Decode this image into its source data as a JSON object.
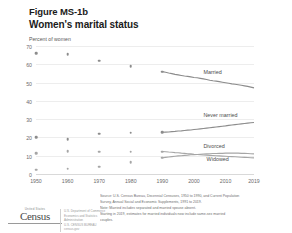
{
  "header": {
    "figure_label": "Figure MS-1b",
    "title": "Women's marital status",
    "axis_title": "Percent of women"
  },
  "footer": {
    "note_lines": [
      "Source: U.S. Census Bureau, Decennial Censuses, 1950 to 1990, and Current Population",
      "Survey, Annual Social and Economic Supplements, 1991 to 2019.",
      "Note: Married includes separated and married spouse absent.",
      "Starting in 2019,  estimates for married individuals now include same-sex married",
      "couples."
    ],
    "logo": {
      "eyebrow": "United States",
      "wordmark": "Census",
      "side_lines": [
        "U.S. Department of Commerce",
        "Economics and Statistics Administration",
        "U.S. CENSUS BUREAU",
        "census.gov"
      ]
    }
  },
  "chart_data": {
    "type": "line",
    "title": "Women's marital status",
    "subtitle": "Figure MS-1b",
    "xlabel": "",
    "ylabel": "Percent of women",
    "xlim": [
      1950,
      2019
    ],
    "ylim": [
      0,
      70
    ],
    "yticks": [
      0,
      10,
      20,
      30,
      40,
      50,
      60,
      70
    ],
    "xticks": [
      1950,
      1960,
      1970,
      1980,
      1990,
      2000,
      2010,
      2019
    ],
    "grid": true,
    "legend_position": "inline-right",
    "decennial_x": [
      1950,
      1960,
      1970,
      1980,
      1990
    ],
    "series": [
      {
        "name": "Married",
        "color": "#8c8c8c",
        "label_x": 2003,
        "label_y": 56,
        "decennial_values": [
          66.1,
          65.6,
          61.9,
          58.9,
          56.0
        ],
        "x": [
          1990,
          1991,
          1992,
          1993,
          1994,
          1995,
          1996,
          1997,
          1998,
          1999,
          2000,
          2001,
          2002,
          2003,
          2004,
          2005,
          2006,
          2007,
          2008,
          2009,
          2010,
          2011,
          2012,
          2013,
          2014,
          2015,
          2016,
          2017,
          2018,
          2019
        ],
        "values": [
          56.0,
          55.6,
          55.2,
          54.9,
          54.5,
          54.2,
          53.9,
          53.6,
          53.4,
          53.1,
          52.8,
          52.6,
          52.3,
          52.0,
          51.7,
          51.3,
          51.0,
          50.8,
          50.5,
          50.2,
          49.9,
          49.6,
          49.3,
          49.1,
          48.8,
          48.5,
          48.2,
          47.9,
          47.5,
          47.1
        ]
      },
      {
        "name": "Never married",
        "color": "#8c8c8c",
        "label_x": 2003,
        "label_y": 32,
        "decennial_values": [
          20.0,
          19.0,
          22.1,
          22.5,
          22.8
        ],
        "x": [
          1990,
          1991,
          1992,
          1993,
          1994,
          1995,
          1996,
          1997,
          1998,
          1999,
          2000,
          2001,
          2002,
          2003,
          2004,
          2005,
          2006,
          2007,
          2008,
          2009,
          2010,
          2011,
          2012,
          2013,
          2014,
          2015,
          2016,
          2017,
          2018,
          2019
        ],
        "values": [
          22.8,
          22.9,
          23.0,
          23.2,
          23.3,
          23.5,
          23.6,
          23.8,
          24.0,
          24.1,
          24.3,
          24.5,
          24.7,
          24.9,
          25.1,
          25.3,
          25.5,
          25.7,
          25.9,
          26.1,
          26.3,
          26.6,
          26.8,
          27.0,
          27.2,
          27.4,
          27.6,
          27.8,
          28.0,
          28.2
        ]
      },
      {
        "name": "Divorced",
        "color": "#a6a6a6",
        "label_x": 2003,
        "label_y": 15.5,
        "decennial_values": [
          2.4,
          2.9,
          3.9,
          6.6,
          8.9
        ],
        "x": [
          1990,
          1991,
          1992,
          1993,
          1994,
          1995,
          1996,
          1997,
          1998,
          1999,
          2000,
          2001,
          2002,
          2003,
          2004,
          2005,
          2006,
          2007,
          2008,
          2009,
          2010,
          2011,
          2012,
          2013,
          2014,
          2015,
          2016,
          2017,
          2018,
          2019
        ],
        "values": [
          8.9,
          9.1,
          9.3,
          9.5,
          9.7,
          9.9,
          10.0,
          10.2,
          10.3,
          10.5,
          10.6,
          10.7,
          10.8,
          10.9,
          11.0,
          11.1,
          11.2,
          11.2,
          11.3,
          11.3,
          11.4,
          11.4,
          11.4,
          11.4,
          11.4,
          11.3,
          11.3,
          11.2,
          11.1,
          11.0
        ]
      },
      {
        "name": "Widowed",
        "color": "#a6a6a6",
        "label_x": 2004,
        "label_y": 8,
        "decennial_values": [
          11.5,
          12.5,
          12.2,
          12.1,
          12.3
        ],
        "x": [
          1990,
          1991,
          1992,
          1993,
          1994,
          1995,
          1996,
          1997,
          1998,
          1999,
          2000,
          2001,
          2002,
          2003,
          2004,
          2005,
          2006,
          2007,
          2008,
          2009,
          2010,
          2011,
          2012,
          2013,
          2014,
          2015,
          2016,
          2017,
          2018,
          2019
        ],
        "values": [
          12.3,
          12.2,
          12.0,
          11.9,
          11.7,
          11.6,
          11.4,
          11.3,
          11.1,
          11.0,
          10.8,
          10.7,
          10.6,
          10.4,
          10.3,
          10.2,
          10.1,
          10.0,
          9.9,
          9.8,
          9.7,
          9.6,
          9.5,
          9.4,
          9.3,
          9.2,
          9.1,
          9.0,
          8.9,
          8.8
        ]
      }
    ]
  }
}
